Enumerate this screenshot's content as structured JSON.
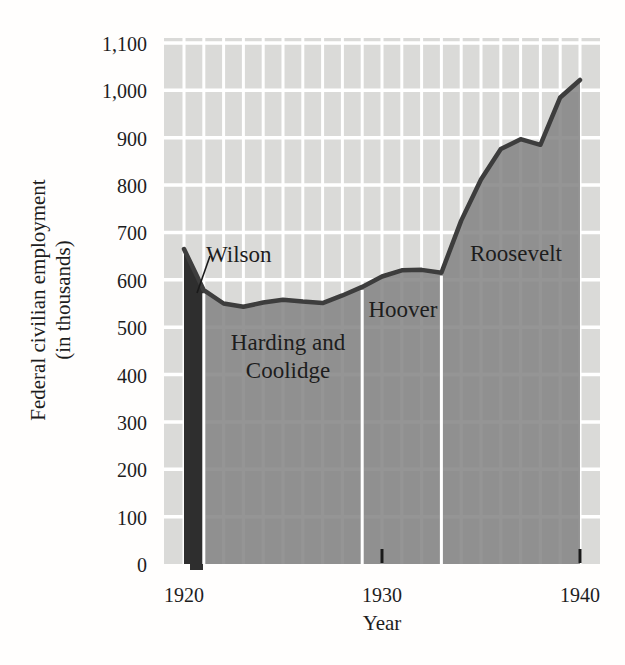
{
  "chart_data": {
    "type": "area",
    "title": "",
    "xlabel": "Year",
    "ylabel_line1": "Federal civilian employment",
    "ylabel_line2": "(in thousands)",
    "x": [
      1920,
      1921,
      1922,
      1923,
      1924,
      1925,
      1926,
      1927,
      1928,
      1929,
      1930,
      1931,
      1932,
      1933,
      1934,
      1935,
      1936,
      1937,
      1938,
      1939,
      1940
    ],
    "values": [
      665,
      578,
      550,
      543,
      552,
      558,
      554,
      551,
      567,
      585,
      607,
      620,
      621,
      615,
      725,
      812,
      876,
      897,
      885,
      985,
      1022
    ],
    "series_name": "Federal civilian employment (thousands)",
    "xlim": [
      1919,
      1941
    ],
    "ylim": [
      0,
      1100
    ],
    "xticks": [
      "1920",
      "1930",
      "1940"
    ],
    "xtick_years": [
      1920,
      1930,
      1940
    ],
    "yticks": [
      0,
      100,
      200,
      300,
      400,
      500,
      600,
      700,
      800,
      900,
      1000,
      1100
    ],
    "ytick_labels": [
      "0",
      "100",
      "200",
      "300",
      "400",
      "500",
      "600",
      "700",
      "800",
      "900",
      "1,000",
      "1,100"
    ],
    "grid": "white gridlines on light-gray plot background; vertical line each year, horizontal line each 100 units",
    "legend": "none",
    "annotations": {
      "wilson": {
        "label": "Wilson",
        "span": [
          1920,
          1921
        ],
        "style": "dark fill with callout line"
      },
      "harding_coolidge": {
        "label_line1": "Harding and",
        "label_line2": "Coolidge",
        "span": [
          1921,
          1929
        ]
      },
      "hoover": {
        "label": "Hoover",
        "span": [
          1929,
          1933
        ]
      },
      "roosevelt": {
        "label": "Roosevelt",
        "span": [
          1933,
          1940
        ]
      }
    },
    "separator_years": [
      1921,
      1929,
      1933
    ],
    "colors": {
      "plot_bg": "#dadad8",
      "grid": "#ffffff",
      "area_fill": "#858585",
      "wilson_fill": "#2e2e2e",
      "line": "#3d3d3d",
      "separator": "#ffffff",
      "tick": "#1a1a1a",
      "text": "#1d1d1d"
    }
  }
}
